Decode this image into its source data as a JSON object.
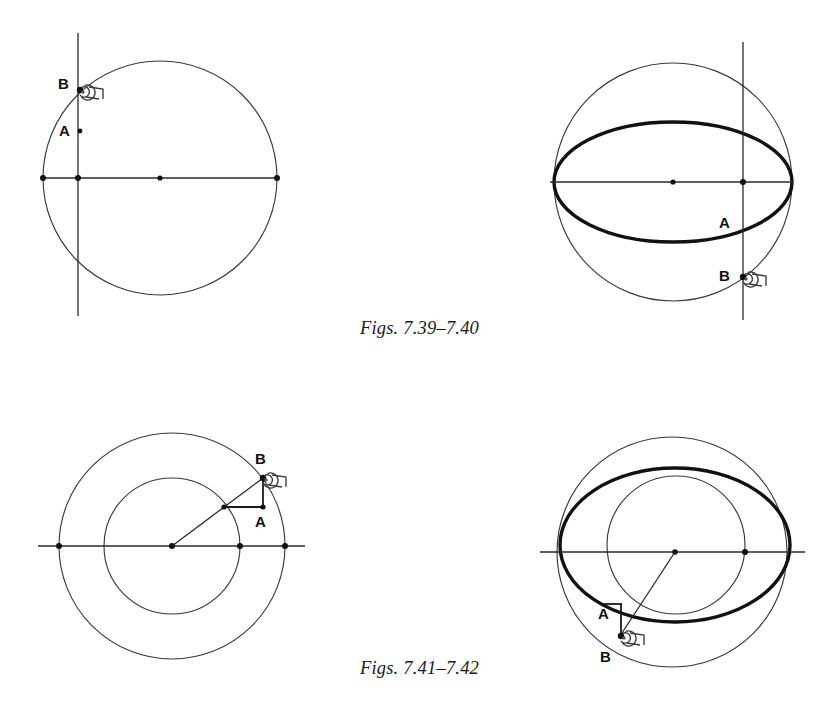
{
  "page": {
    "width": 839,
    "height": 710,
    "background": "#ffffff",
    "ink": "#111111",
    "thin_stroke": "#3a3a3a"
  },
  "captions": [
    {
      "id": "caption-top",
      "text": "Figs. 7.39–7.40"
    },
    {
      "id": "caption-bottom",
      "text": "Figs. 7.41–7.42"
    }
  ],
  "figures": [
    {
      "id": "fig-7-39",
      "name": "circle-with-chord-line",
      "position": "top-left",
      "labels": {
        "a": "A",
        "b": "B"
      },
      "geometry": {
        "circle": {
          "cx": 160,
          "cy": 178,
          "r": 117
        },
        "horizontal_axis": {
          "x1": 43,
          "y1": 178,
          "x2": 278,
          "y2": 178
        },
        "vertical_line": {
          "x": 78,
          "y1": 33,
          "y2": 316
        },
        "dots": [
          {
            "x": 43,
            "y": 178
          },
          {
            "x": 78,
            "y": 178
          },
          {
            "x": 160,
            "y": 178
          },
          {
            "x": 277,
            "y": 178
          }
        ],
        "point_a": {
          "x": 78,
          "y": 131
        },
        "point_b": {
          "x": 80,
          "y": 90
        },
        "marker_b": {
          "x": 88,
          "y": 93
        }
      }
    },
    {
      "id": "fig-7-40",
      "name": "sphere-with-equator-ellipse",
      "position": "top-right",
      "labels": {
        "a": "A",
        "b": "B"
      },
      "geometry": {
        "circle": {
          "cx": 673,
          "cy": 182,
          "r": 119
        },
        "ellipse": {
          "cx": 673,
          "cy": 182,
          "rx": 119,
          "ry": 60
        },
        "horizontal_axis": {
          "x1": 550,
          "y1": 182,
          "x2": 793,
          "y2": 182
        },
        "vertical_line": {
          "x": 743,
          "y1": 42,
          "y2": 320
        },
        "dots": [
          {
            "x": 673,
            "y": 182
          },
          {
            "x": 743,
            "y": 182
          }
        ],
        "point_a": {
          "x": 743,
          "y": 216
        },
        "point_b": {
          "x": 743,
          "y": 277
        },
        "marker_b": {
          "x": 751,
          "y": 279
        }
      }
    },
    {
      "id": "fig-7-41",
      "name": "concentric-circles-with-right-triangle",
      "position": "bottom-left",
      "labels": {
        "a": "A",
        "b": "B"
      },
      "geometry": {
        "outer_circle": {
          "cx": 172,
          "cy": 546,
          "r": 113
        },
        "inner_circle": {
          "cx": 172,
          "cy": 546,
          "r": 68
        },
        "horizontal_axis": {
          "x1": 38,
          "y1": 546,
          "x2": 305,
          "y2": 546
        },
        "dots": [
          {
            "x": 59,
            "y": 546
          },
          {
            "x": 172,
            "y": 546
          },
          {
            "x": 240,
            "y": 546
          },
          {
            "x": 285,
            "y": 546
          }
        ],
        "radius_line": {
          "x1": 172,
          "y1": 546,
          "x2": 263,
          "y2": 478
        },
        "triangle_vertex": {
          "x": 224,
          "y": 507
        },
        "point_a": {
          "x": 263,
          "y": 507
        },
        "point_b": {
          "x": 263,
          "y": 478
        },
        "marker_b": {
          "x": 271,
          "y": 481
        }
      }
    },
    {
      "id": "fig-7-42",
      "name": "sphere-with-offset-circle-and-ellipse",
      "position": "bottom-right",
      "labels": {
        "a": "A",
        "b": "B"
      },
      "geometry": {
        "outer_circle": {
          "cx": 672,
          "cy": 552,
          "r": 115
        },
        "inner_circle": {
          "cx": 676,
          "cy": 545,
          "r": 69
        },
        "ellipse": {
          "cx": 675,
          "cy": 545,
          "rx": 115,
          "ry": 77
        },
        "horizontal_axis": {
          "x1": 540,
          "y1": 552,
          "x2": 805,
          "y2": 552
        },
        "dots": [
          {
            "x": 675,
            "y": 552
          },
          {
            "x": 745,
            "y": 552
          }
        ],
        "radius_line": {
          "x1": 675,
          "y1": 552,
          "x2": 621,
          "y2": 632
        },
        "point_a": {
          "x": 612,
          "y": 614
        },
        "point_b": {
          "x": 613,
          "y": 645
        },
        "vertical_leg": {
          "x": 621,
          "y1": 604,
          "y2": 633
        },
        "marker_b": {
          "x": 621,
          "y": 636
        }
      }
    }
  ]
}
